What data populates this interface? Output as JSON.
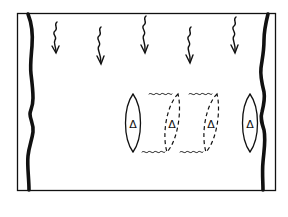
{
  "diagram": {
    "colors": {
      "ink": "#111111",
      "background": "#ffffff"
    },
    "frame": {
      "x": 17,
      "y": 13,
      "width": 258,
      "height": 177
    },
    "arrows": [
      {
        "x": 56,
        "top": 22,
        "bottom": 52
      },
      {
        "x": 100,
        "top": 27,
        "bottom": 63
      },
      {
        "x": 145,
        "top": 16,
        "bottom": 52
      },
      {
        "x": 190,
        "top": 27,
        "bottom": 62
      },
      {
        "x": 235,
        "top": 17,
        "bottom": 52
      }
    ],
    "objects": [
      {
        "id": "start",
        "style": "solid",
        "cx": 133,
        "cy": 123,
        "rx": 9,
        "ry": 29,
        "label": "Δ"
      },
      {
        "id": "mid1",
        "style": "dashed",
        "cx": 172,
        "cy": 123,
        "rx": 9,
        "ry": 29,
        "label": "Δ"
      },
      {
        "id": "mid2",
        "style": "dashed",
        "cx": 211,
        "cy": 123,
        "rx": 9,
        "ry": 29,
        "label": "Δ"
      },
      {
        "id": "end",
        "style": "solid",
        "cx": 250,
        "cy": 123,
        "rx": 9,
        "ry": 29,
        "label": "Δ"
      }
    ]
  }
}
